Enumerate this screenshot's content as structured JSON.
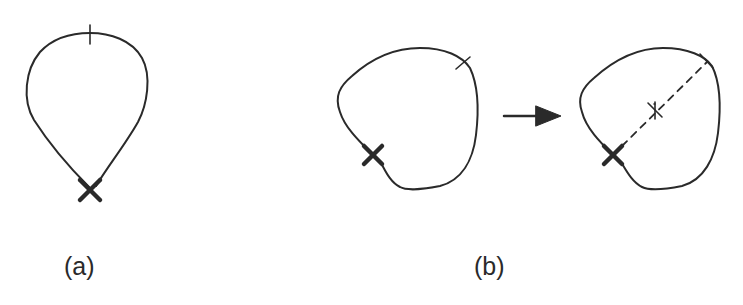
{
  "figure": {
    "panels": [
      {
        "id": "a",
        "label": "(a)",
        "description": "Teardrop-shaped closed loop with a small tick mark at the top and a bold X at the bottom cusp"
      },
      {
        "id": "b",
        "label": "(b)",
        "description": "Rounded closed loop with a tick mark at upper right and a bold X at lower left, arrow pointing to the same loop with a dashed chord drawn from the X to the tick mark, with a small cross tick at the chord midpoint"
      }
    ],
    "arrow": {
      "direction": "right"
    },
    "colors": {
      "stroke": "#2a2a2a",
      "background": "#ffffff"
    }
  }
}
